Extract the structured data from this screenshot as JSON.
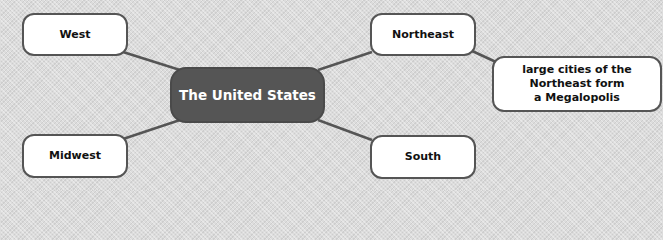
{
  "diagram": {
    "type": "mind-map",
    "center": {
      "label": "The United States"
    },
    "nodes": [
      {
        "id": "west",
        "label": "West"
      },
      {
        "id": "northeast",
        "label": "Northeast"
      },
      {
        "id": "midwest",
        "label": "Midwest"
      },
      {
        "id": "south",
        "label": "South"
      },
      {
        "id": "northeast-detail",
        "lines": [
          "large cities of the",
          "Northeast form",
          "a Megalopolis"
        ]
      }
    ],
    "edges": [
      [
        "The United States",
        "West"
      ],
      [
        "The United States",
        "Northeast"
      ],
      [
        "The United States",
        "Midwest"
      ],
      [
        "The United States",
        "South"
      ],
      [
        "Northeast",
        "large cities of the Northeast form a Megalopolis"
      ]
    ],
    "colors": {
      "center_fill": "#555555",
      "node_fill": "#ffffff",
      "border": "#555555",
      "link": "#555555",
      "background": "#dcdcdc"
    }
  }
}
